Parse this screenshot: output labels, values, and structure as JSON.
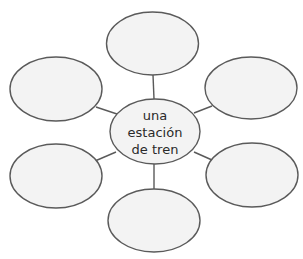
{
  "diagram": {
    "type": "word-web",
    "center": {
      "lines": [
        "una",
        "estación",
        "de tren"
      ]
    },
    "branches": [
      {
        "position": "top",
        "text": ""
      },
      {
        "position": "upper-left",
        "text": ""
      },
      {
        "position": "upper-right",
        "text": ""
      },
      {
        "position": "lower-left",
        "text": ""
      },
      {
        "position": "lower-right",
        "text": ""
      },
      {
        "position": "bottom",
        "text": ""
      }
    ],
    "colors": {
      "stroke": "#5a5a5a",
      "fill": "#f3f3f3",
      "background": "#ffffff",
      "text": "#2a2a2a"
    }
  }
}
